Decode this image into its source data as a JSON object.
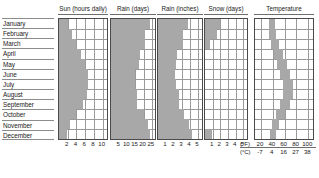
{
  "months": [
    "January",
    "February",
    "March",
    "April",
    "May",
    "June",
    "July",
    "August",
    "September",
    "October",
    "November",
    "December"
  ],
  "panels": {
    "sun": {
      "title": "Sun (hours daily)"
    },
    "raind": {
      "title": "Rain (days)"
    },
    "raini": {
      "title": "Rain (inches)"
    },
    "snow": {
      "title": "Snow (days)"
    },
    "temp": {
      "title": "Temperature"
    }
  },
  "units": {
    "fahrenheit": "(°F)",
    "celsius": "(°C)"
  },
  "chart_data": [
    {
      "type": "bar",
      "title": "Sun (hours daily)",
      "orientation": "horizontal",
      "categories": [
        "January",
        "February",
        "March",
        "April",
        "May",
        "June",
        "July",
        "August",
        "September",
        "October",
        "November",
        "December"
      ],
      "values": [
        2.0,
        3.0,
        4.0,
        5.0,
        6.0,
        6.6,
        6.6,
        6.4,
        5.6,
        4.0,
        2.6,
        1.8
      ],
      "xlabel": "",
      "ylabel": "",
      "xlim": [
        0,
        11
      ],
      "ticks": [
        2,
        4,
        6,
        8,
        10
      ],
      "ticklabels": [
        "2",
        "4",
        "6",
        "8",
        "10"
      ],
      "grid": true
    },
    {
      "type": "bar",
      "title": "Rain (days)",
      "orientation": "horizontal",
      "categories": [
        "January",
        "February",
        "March",
        "April",
        "May",
        "June",
        "July",
        "August",
        "September",
        "October",
        "November",
        "December"
      ],
      "values": [
        24.0,
        21.0,
        21.0,
        18.0,
        17.0,
        15.0,
        15.0,
        16.0,
        16.0,
        20.0,
        23.0,
        24.0
      ],
      "xlabel": "",
      "ylabel": "",
      "xlim": [
        0,
        27
      ],
      "ticks": [
        5,
        10,
        15,
        20,
        25
      ],
      "ticklabels": [
        "5",
        "10",
        "15",
        "20",
        "25"
      ],
      "grid": true
    },
    {
      "type": "bar",
      "title": "Rain (inches)",
      "orientation": "horizontal",
      "categories": [
        "January",
        "February",
        "March",
        "April",
        "May",
        "June",
        "July",
        "August",
        "September",
        "October",
        "November",
        "December"
      ],
      "values": [
        3.8,
        3.1,
        3.1,
        2.4,
        2.3,
        2.1,
        2.3,
        2.6,
        2.6,
        3.2,
        3.9,
        4.2
      ],
      "xlabel": "",
      "ylabel": "",
      "xlim": [
        0,
        5.5
      ],
      "ticks": [
        1,
        2,
        3,
        4,
        5
      ],
      "ticklabels": [
        "1",
        "2",
        "3",
        "4",
        "5"
      ],
      "grid": true
    },
    {
      "type": "bar",
      "title": "Snow (days)",
      "orientation": "horizontal",
      "categories": [
        "January",
        "February",
        "March",
        "April",
        "May",
        "June",
        "July",
        "August",
        "September",
        "October",
        "November",
        "December"
      ],
      "values": [
        2.0,
        1.6,
        0.7,
        0,
        0,
        0,
        0,
        0,
        0,
        0,
        0,
        0.9
      ],
      "xlabel": "",
      "ylabel": "",
      "xlim": [
        0,
        5.5
      ],
      "ticks": [
        1,
        2,
        3,
        4,
        5
      ],
      "ticklabels": [
        "1",
        "2",
        "3",
        "4",
        "5"
      ],
      "grid": true
    },
    {
      "type": "area",
      "title": "Temperature",
      "orientation": "horizontal",
      "categories": [
        "January",
        "February",
        "March",
        "April",
        "May",
        "June",
        "July",
        "August",
        "September",
        "October",
        "November",
        "December"
      ],
      "series": [
        {
          "name": "low",
          "values": [
            33,
            34,
            37,
            42,
            48,
            53,
            57,
            57,
            53,
            46,
            39,
            35
          ]
        },
        {
          "name": "high",
          "values": [
            44,
            46,
            51,
            57,
            64,
            69,
            75,
            74,
            69,
            60,
            50,
            45
          ]
        }
      ],
      "xlabel": "",
      "ylabel": "",
      "xlim": [
        10,
        108
      ],
      "ticks": [
        20,
        40,
        60,
        80,
        100
      ],
      "ticklabels_f": [
        "20",
        "40",
        "60",
        "80",
        "100"
      ],
      "ticklabels_c": [
        "-7",
        "4",
        "16",
        "27",
        "38"
      ],
      "units_f": "(°F)",
      "units_c": "(°C)",
      "grid": true
    }
  ]
}
